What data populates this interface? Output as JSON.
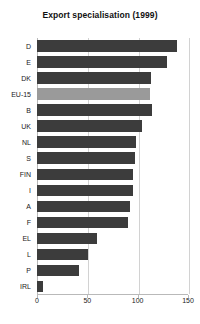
{
  "chart_data": {
    "type": "bar",
    "orientation": "horizontal",
    "title": "Export specialisation (1999)",
    "xlabel": "",
    "ylabel": "",
    "categories": [
      "D",
      "E",
      "DK",
      "EU-15",
      "B",
      "UK",
      "NL",
      "S",
      "FIN",
      "I",
      "A",
      "F",
      "EL",
      "L",
      "P",
      "IRL"
    ],
    "values": [
      139,
      129,
      113,
      112,
      114,
      104,
      98,
      97,
      95,
      95,
      92,
      90,
      60,
      51,
      42,
      6
    ],
    "highlight_category": "EU-15",
    "xlim": [
      0,
      150
    ],
    "xticks": [
      0,
      50,
      100,
      150
    ],
    "xtick_labels": [
      "0",
      "50",
      "100",
      "150"
    ],
    "grid": true,
    "legend": "none",
    "bar_color": "#3c3c3c",
    "highlight_color": "#9a9a9a",
    "grid_color": "#d2d2d2",
    "axis_color": "#b9b9b9"
  }
}
